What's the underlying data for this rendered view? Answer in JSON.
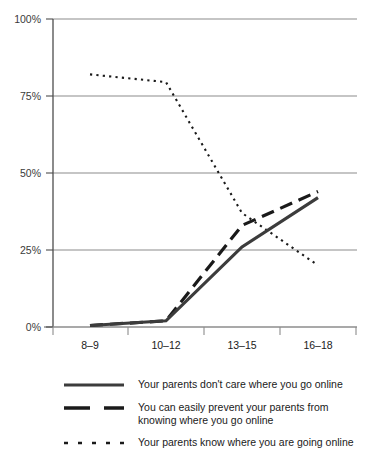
{
  "chart_data": {
    "type": "line",
    "title": "",
    "subtitle": "",
    "xlabel": "% Yes",
    "ylabel": "",
    "categories": [
      "8–9",
      "10–12",
      "13–15",
      "16–18"
    ],
    "ylim": [
      0,
      100
    ],
    "ytick_labels": [
      "0%",
      "25%",
      "50%",
      "75%",
      "100%"
    ],
    "ytick_values": [
      0,
      25,
      50,
      75,
      100
    ],
    "grid": "horizontal",
    "legend_position": "below",
    "series": [
      {
        "name": "Your parents don't care where you go online",
        "style": "solid",
        "color": "#3c3c3c",
        "values": [
          0.5,
          2,
          26,
          42
        ]
      },
      {
        "name": "You can easily prevent your parents from\nknowing where you go online",
        "style": "dashed",
        "color": "#1a1a1a",
        "values": [
          0.5,
          2,
          33,
          44
        ]
      },
      {
        "name": "Your parents know where you are going online",
        "style": "dotted",
        "color": "#1a1a1a",
        "values": [
          82,
          79.5,
          37,
          20
        ]
      }
    ]
  },
  "axes": {
    "x_title": "% Yes",
    "x_categories": [
      "8–9",
      "10–12",
      "13–15",
      "16–18"
    ],
    "y_labels": [
      "100%",
      "75%",
      "50%",
      "25%",
      "0%"
    ]
  },
  "legend": {
    "items": [
      {
        "label": "Your parents don't care where you go online",
        "style": "solid"
      },
      {
        "label": "You can easily prevent your parents from\nknowing where you go online",
        "style": "dashed"
      },
      {
        "label": "Your parents know where you are going online",
        "style": "dotted"
      }
    ]
  }
}
